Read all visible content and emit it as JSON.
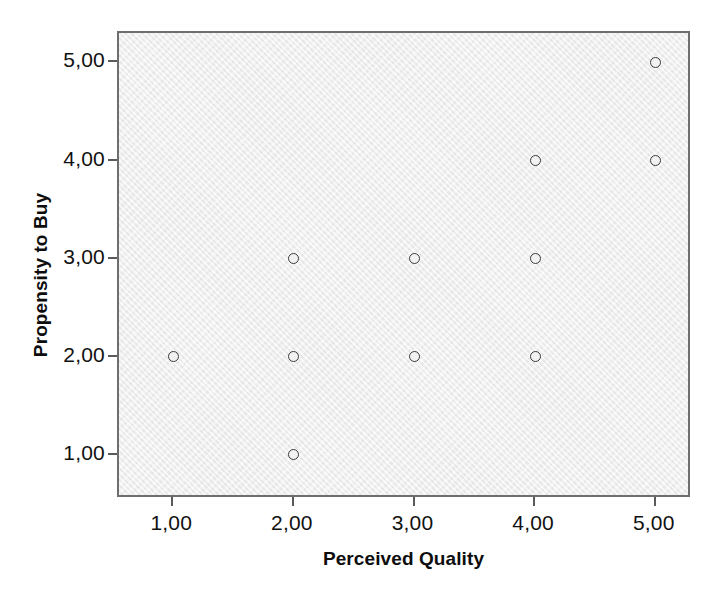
{
  "chart_data": {
    "type": "scatter",
    "title": "",
    "xlabel": "Perceived Quality",
    "ylabel": "Propensity to Buy",
    "xtick_labels": [
      "1,00",
      "2,00",
      "3,00",
      "4,00",
      "5,00"
    ],
    "ytick_labels": [
      "1,00",
      "2,00",
      "3,00",
      "4,00",
      "5,00"
    ],
    "xticks": [
      1,
      2,
      3,
      4,
      5
    ],
    "yticks": [
      1,
      2,
      3,
      4,
      5
    ],
    "xlim": [
      0.55,
      5.3
    ],
    "ylim": [
      0.55,
      5.3
    ],
    "grid": false,
    "legend": "none",
    "marker": "open-circle",
    "marker_edge_color": "#3b3b3b",
    "marker_face_color": "#f2f2f2",
    "panel_background": "#ececec",
    "panel_border_color": "#6e6e6e",
    "figure_background": "#ffffff",
    "points": [
      {
        "x": 1,
        "y": 2
      },
      {
        "x": 2,
        "y": 1
      },
      {
        "x": 2,
        "y": 2
      },
      {
        "x": 2,
        "y": 3
      },
      {
        "x": 3,
        "y": 2
      },
      {
        "x": 3,
        "y": 3
      },
      {
        "x": 4,
        "y": 2
      },
      {
        "x": 4,
        "y": 3
      },
      {
        "x": 4,
        "y": 4
      },
      {
        "x": 5,
        "y": 4
      },
      {
        "x": 5,
        "y": 5
      }
    ]
  }
}
